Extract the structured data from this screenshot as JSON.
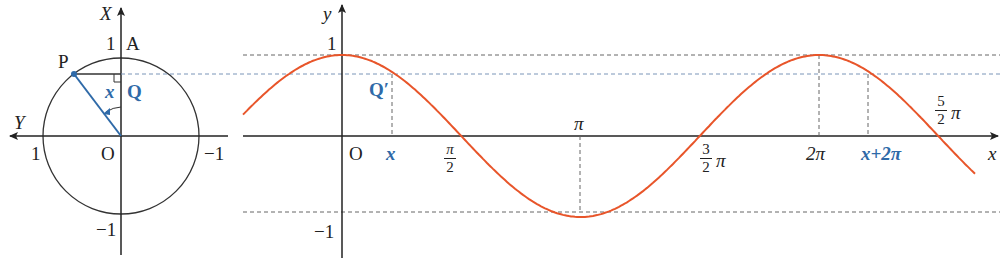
{
  "circle": {
    "axis_vertical_label": "X",
    "axis_horizontal_label": "Y",
    "point_A": "A",
    "point_P": "P",
    "point_Q": "Q",
    "origin": "O",
    "angle_label": "x",
    "tick_top": "1",
    "tick_bottom": "−1",
    "tick_left": "1",
    "tick_right": "−1"
  },
  "graph": {
    "y_axis_label": "y",
    "x_axis_label": "x",
    "origin": "O",
    "y_tick_1": "1",
    "y_tick_neg1": "−1",
    "point_Qprime": "Q′",
    "tick_x": "x",
    "tick_pi_half_num": "π",
    "tick_pi_half_den": "2",
    "tick_pi": "π",
    "tick_3pi2_num": "3",
    "tick_3pi2_den": "2",
    "tick_3pi2_suffix": "π",
    "tick_2pi": "2π",
    "tick_x_plus_2pi": "x+2π",
    "tick_5pi2_num": "5",
    "tick_5pi2_den": "2",
    "tick_5pi2_suffix": "π"
  },
  "colors": {
    "curve": "#e8552a",
    "accent_blue": "#2f6aa8",
    "axis": "#222222",
    "dashed": "#555555"
  },
  "chart_data": {
    "type": "line",
    "title": "",
    "function": "y = cos x",
    "xlabel": "x",
    "ylabel": "y",
    "x_ticks": [
      "x",
      "π/2",
      "π",
      "3π/2",
      "2π",
      "x+2π",
      "5π/2"
    ],
    "ylim": [
      -1,
      1
    ],
    "x_range": [
      -1.3,
      8.5
    ],
    "series": [
      {
        "name": "y = cos x",
        "color": "#e8552a"
      }
    ]
  }
}
